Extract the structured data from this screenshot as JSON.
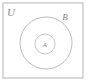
{
  "diagram": {
    "type": "euler-venn",
    "background_color": "#ffffff",
    "stroke_color": "#b9b9b9",
    "universe": {
      "label": "U",
      "shape": "rectangle",
      "x": 3,
      "y": 3,
      "width": 80,
      "height": 75,
      "label_x": 11,
      "label_y": 16
    },
    "sets": [
      {
        "name": "set-b",
        "label": "B",
        "shape": "circle",
        "cx": 46,
        "cy": 43,
        "r": 26,
        "label_x": 65,
        "label_y": 20
      },
      {
        "name": "set-a",
        "label": "A",
        "shape": "circle",
        "cx": 45,
        "cy": 44,
        "r": 10,
        "label_x": 45,
        "label_y": 47
      }
    ]
  }
}
